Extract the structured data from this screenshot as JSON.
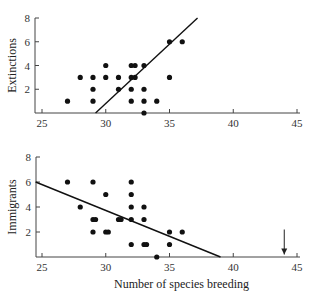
{
  "chart_data": [
    {
      "type": "scatter",
      "title": "",
      "xlabel": "",
      "ylabel": "Extinctions",
      "xlim": [
        24.5,
        45
      ],
      "ylim": [
        0,
        8
      ],
      "xticks": [
        25,
        30,
        35,
        40,
        45
      ],
      "yticks": [
        2,
        4,
        6,
        8
      ],
      "grid": false,
      "points": [
        [
          27,
          1
        ],
        [
          28,
          3
        ],
        [
          29,
          3
        ],
        [
          29,
          2
        ],
        [
          29,
          1
        ],
        [
          30,
          4
        ],
        [
          30,
          3
        ],
        [
          31,
          3
        ],
        [
          31,
          2
        ],
        [
          32,
          4
        ],
        [
          32,
          3
        ],
        [
          32,
          2
        ],
        [
          32,
          1
        ],
        [
          32.3,
          4
        ],
        [
          32.3,
          3
        ],
        [
          33,
          4
        ],
        [
          33,
          2
        ],
        [
          33,
          1
        ],
        [
          33,
          0
        ],
        [
          34,
          1
        ],
        [
          35,
          6
        ],
        [
          35,
          3
        ],
        [
          36,
          6
        ]
      ],
      "fit_line": {
        "x1": 29.2,
        "y1": 0,
        "x2": 37.2,
        "y2": 8
      }
    },
    {
      "type": "scatter",
      "title": "",
      "xlabel": "Number of species breeding",
      "ylabel": "Immigrants",
      "xlim": [
        24.5,
        45
      ],
      "ylim": [
        0,
        8
      ],
      "xticks": [
        25,
        30,
        35,
        40,
        45
      ],
      "yticks": [
        2,
        4,
        6,
        8
      ],
      "grid": false,
      "points": [
        [
          27,
          6
        ],
        [
          28,
          4
        ],
        [
          29,
          6
        ],
        [
          29,
          3
        ],
        [
          29.2,
          3
        ],
        [
          29,
          2
        ],
        [
          30,
          5
        ],
        [
          30,
          2
        ],
        [
          30.2,
          2
        ],
        [
          31,
          3
        ],
        [
          31.2,
          3
        ],
        [
          32,
          6
        ],
        [
          32,
          5
        ],
        [
          32,
          4
        ],
        [
          32,
          3
        ],
        [
          32,
          1
        ],
        [
          33,
          4
        ],
        [
          33,
          3
        ],
        [
          33,
          1
        ],
        [
          33.2,
          1
        ],
        [
          34,
          0
        ],
        [
          35,
          2
        ],
        [
          35,
          1
        ],
        [
          36,
          2
        ]
      ],
      "fit_line": {
        "x1": 24.5,
        "y1": 6,
        "x2": 39,
        "y2": 0
      },
      "annotation": {
        "type": "arrow-down",
        "x": 44,
        "y_from": 2.2,
        "y_to": 0.2
      }
    }
  ]
}
